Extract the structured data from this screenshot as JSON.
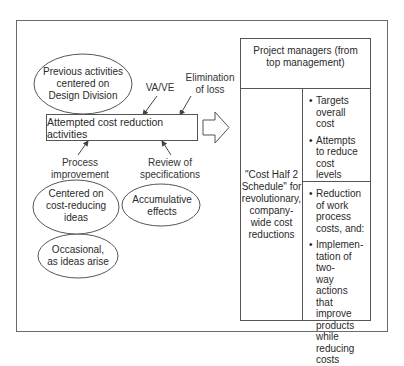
{
  "diagram": {
    "top_ellipse": {
      "lines": [
        "Previous activities",
        "centered on",
        "Design Division"
      ]
    },
    "input_labels": {
      "va_ve": "VA/VE",
      "elimination": [
        "Elimination",
        "of loss"
      ],
      "process": [
        "Process",
        "improvement"
      ],
      "review": [
        "Review of",
        "specifications"
      ]
    },
    "center_box": {
      "label": "Attempted cost reduction activities"
    },
    "bottom_ellipses": {
      "centered": [
        "Centered on",
        "cost-reducing",
        "ideas"
      ],
      "occasional": [
        "Occasional,",
        "as ideas arise"
      ],
      "accumulative": [
        "Accumulative",
        "effects"
      ]
    },
    "arrow": {
      "icon": "right-block-arrow"
    },
    "right_box": {
      "header": [
        "Project managers (from",
        "top management)"
      ],
      "left_cell": [
        "\"Cost Half 2",
        "Schedule\" for",
        "revolutionary,",
        "company-",
        "wide cost",
        "reductions"
      ],
      "top_bullets": [
        [
          "Targets",
          "overall",
          "cost"
        ],
        [
          "Attempts",
          "to reduce",
          "cost",
          "levels"
        ]
      ],
      "bottom_bullets": [
        [
          "Reduction",
          "of work",
          "process",
          "costs, and:"
        ],
        [
          "Implemen-",
          "tation of two-",
          "way actions",
          "that improve",
          "products",
          "while",
          "reducing",
          "costs"
        ]
      ]
    },
    "colors": {
      "line": "#555555",
      "text": "#333333",
      "frame": "#6a6a6a"
    }
  }
}
